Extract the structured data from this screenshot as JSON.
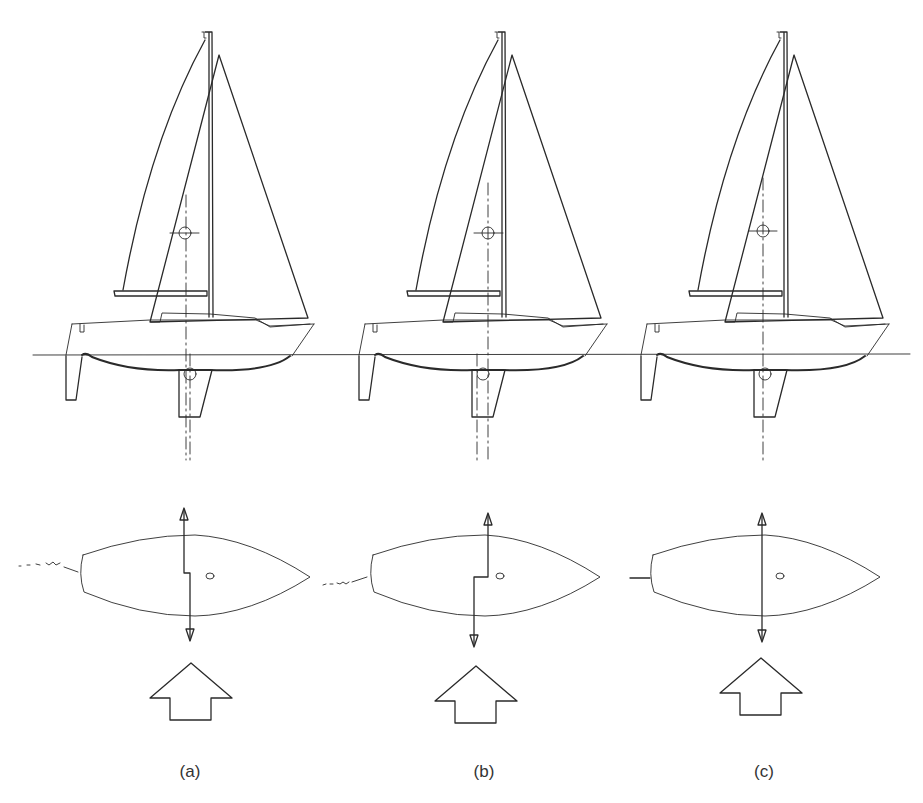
{
  "figure": {
    "panels": [
      {
        "id": "a",
        "label": "(a)",
        "ce_x": 185,
        "clr_x": 190,
        "offset": 0,
        "jog": [
          7,
          0
        ],
        "wake": "rough",
        "label_x": 190
      },
      {
        "id": "b",
        "label": "(b)",
        "ce_x": 488,
        "clr_x": 478,
        "offset": 300,
        "jog": [
          -10,
          0
        ],
        "wake": "rough",
        "label_x": 484
      },
      {
        "id": "c",
        "label": "(c)",
        "ce_x": 763,
        "clr_x": 763,
        "offset": 585,
        "jog": [
          0,
          0
        ],
        "wake": "straight",
        "label_x": 764
      }
    ],
    "waterline_y": 354,
    "elements": {
      "center_of_effort_marker": "circle-crosshair",
      "center_of_lateral_resistance_marker": "circle",
      "force_arrows": "double-headed vertical",
      "wind_arrow": "block-up-arrow"
    }
  }
}
